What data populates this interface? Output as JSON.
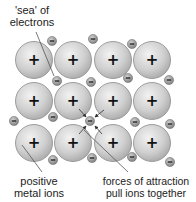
{
  "diagram": {
    "labels": {
      "sea_line1": "'sea' of",
      "sea_line2": "electrons",
      "ions_line1": "positive",
      "ions_line2": "metal ions",
      "forces_line1": "forces of attraction",
      "forces_line2": "pull ions together"
    },
    "ion_symbol": "+",
    "electron_symbol": "−",
    "ions": [
      {
        "x": 34,
        "y": 60
      },
      {
        "x": 73,
        "y": 60
      },
      {
        "x": 113,
        "y": 60
      },
      {
        "x": 152,
        "y": 60
      },
      {
        "x": 34,
        "y": 101
      },
      {
        "x": 73,
        "y": 101
      },
      {
        "x": 113,
        "y": 101
      },
      {
        "x": 152,
        "y": 101
      },
      {
        "x": 34,
        "y": 143
      },
      {
        "x": 73,
        "y": 143
      },
      {
        "x": 113,
        "y": 143
      },
      {
        "x": 152,
        "y": 143
      }
    ],
    "electrons": [
      {
        "x": 52,
        "y": 41
      },
      {
        "x": 93,
        "y": 39
      },
      {
        "x": 132,
        "y": 44
      },
      {
        "x": 57,
        "y": 81
      },
      {
        "x": 91,
        "y": 82
      },
      {
        "x": 128,
        "y": 78
      },
      {
        "x": 169,
        "y": 80
      },
      {
        "x": 14,
        "y": 121
      },
      {
        "x": 53,
        "y": 117
      },
      {
        "x": 90,
        "y": 121
      },
      {
        "x": 135,
        "y": 122
      },
      {
        "x": 170,
        "y": 124
      },
      {
        "x": 53,
        "y": 160
      },
      {
        "x": 92,
        "y": 158
      },
      {
        "x": 132,
        "y": 157
      },
      {
        "x": 170,
        "y": 162
      }
    ],
    "colors": {
      "ion_fill": "#c8c8c8",
      "ion_stroke": "#8a8a8a",
      "electron_fill": "#9a9a9a",
      "line": "#555555",
      "text": "#222222"
    }
  }
}
